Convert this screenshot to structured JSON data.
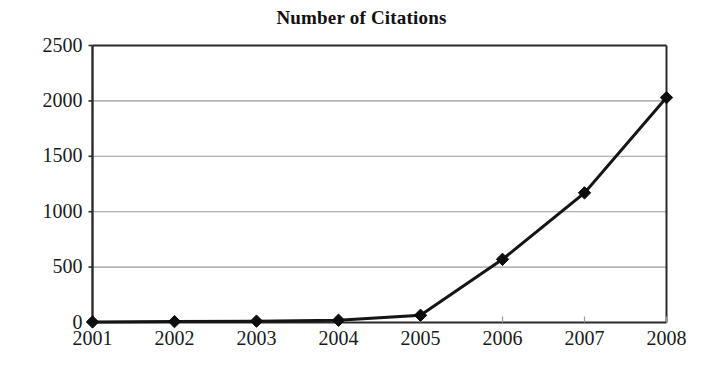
{
  "chart_data": {
    "type": "line",
    "title": "Number of Citations",
    "xlabel": "",
    "ylabel": "",
    "categories": [
      "2001",
      "2002",
      "2003",
      "2004",
      "2005",
      "2006",
      "2007",
      "2008"
    ],
    "values": [
      5,
      8,
      12,
      20,
      65,
      570,
      1170,
      2030
    ],
    "series": [
      {
        "name": "Number of Citations",
        "values": [
          5,
          8,
          12,
          20,
          65,
          570,
          1170,
          2030
        ]
      }
    ],
    "ylim": [
      0,
      2500
    ],
    "yticks": [
      "0",
      "500",
      "1000",
      "1500",
      "2000",
      "2500"
    ],
    "ytick_values": [
      0,
      500,
      1000,
      1500,
      2000,
      2500
    ],
    "grid": "horizontal",
    "legend": "none",
    "marker": "diamond",
    "line_color": "#151515",
    "marker_color": "#0d0d0d",
    "grid_color": "#9a9a9a",
    "axis_color": "#2b2b2b",
    "background_color": "#ffffff"
  },
  "axis": {
    "y_labels": [
      "2500",
      "2000",
      "1500",
      "1000",
      "500",
      "0"
    ],
    "x_labels": [
      "2001",
      "2002",
      "2003",
      "2004",
      "2005",
      "2006",
      "2007",
      "2008"
    ]
  }
}
